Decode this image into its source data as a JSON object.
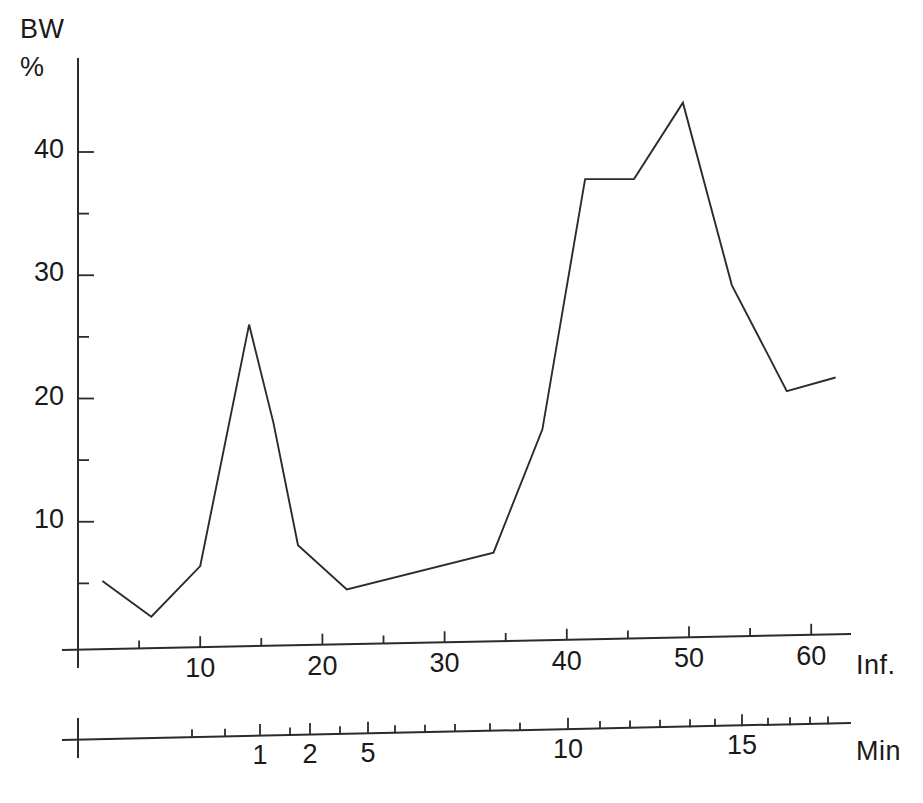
{
  "chart_data": {
    "type": "line",
    "title": "",
    "ylabel": "BW %",
    "ylabel_lines": [
      "BW",
      "%"
    ],
    "xlabel": "Inf.",
    "xlabel_secondary": "Min",
    "ylim": [
      0,
      46
    ],
    "xlim": [
      0,
      64
    ],
    "grid": false,
    "legend": null,
    "y_ticks_major": [
      10,
      20,
      30,
      40
    ],
    "y_ticks_minor": [
      5,
      15,
      25,
      35
    ],
    "y_tick_labels": [
      "10",
      "20",
      "30",
      "40"
    ],
    "x_ticks_major": [
      10,
      20,
      30,
      40,
      50,
      60
    ],
    "x_tick_labels": [
      "10",
      "20",
      "30",
      "40",
      "50",
      "60"
    ],
    "x_ticks_minor": [
      5,
      15,
      25,
      35,
      45,
      55
    ],
    "x_secondary_ticks": [
      1,
      2,
      5,
      10,
      15
    ],
    "x_secondary_tick_labels": [
      "1",
      "2",
      "5",
      "10",
      "15"
    ],
    "x": [
      2,
      6,
      10,
      14,
      16,
      18,
      22,
      34,
      38,
      41.5,
      45.5,
      49.5,
      53.5,
      58,
      62
    ],
    "values": [
      5.2,
      2.3,
      6.4,
      26.0,
      18.0,
      8.1,
      4.5,
      7.5,
      17.5,
      37.8,
      37.8,
      44.0,
      29.2,
      20.6,
      21.7
    ],
    "series": [
      {
        "name": "BW %",
        "points": [
          {
            "x": 2,
            "y": 5.2
          },
          {
            "x": 6,
            "y": 2.3
          },
          {
            "x": 10,
            "y": 6.4
          },
          {
            "x": 14,
            "y": 26.0
          },
          {
            "x": 16,
            "y": 18.0
          },
          {
            "x": 18,
            "y": 8.1
          },
          {
            "x": 22,
            "y": 4.5
          },
          {
            "x": 34,
            "y": 7.5
          },
          {
            "x": 38,
            "y": 17.5
          },
          {
            "x": 41.5,
            "y": 37.8
          },
          {
            "x": 45.5,
            "y": 37.8
          },
          {
            "x": 49.5,
            "y": 44.0
          },
          {
            "x": 53.5,
            "y": 29.2
          },
          {
            "x": 58,
            "y": 20.6
          },
          {
            "x": 62,
            "y": 21.7
          }
        ]
      }
    ],
    "annotations": []
  },
  "labels": {
    "y_axis_line1": "BW",
    "y_axis_line2": "%",
    "x_axis_primary": "Inf.",
    "x_axis_secondary": "Min"
  },
  "colors": {
    "curve": "#2b2b2b",
    "axis": "#2b2b2b",
    "background": "#ffffff",
    "text": "#1a1a1a"
  }
}
